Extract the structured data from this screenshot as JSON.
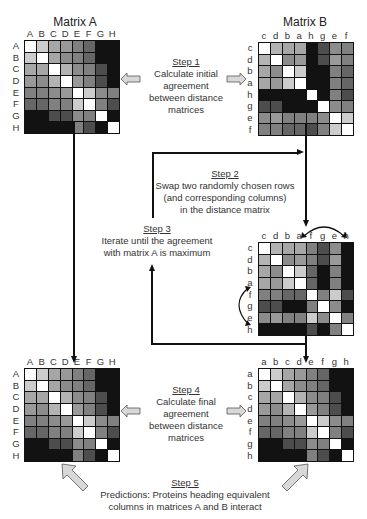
{
  "titles": {
    "matrix_a": "Matrix A",
    "matrix_b": "Matrix B"
  },
  "matrices": {
    "top_left": {
      "cols": [
        "A",
        "B",
        "C",
        "D",
        "E",
        "F",
        "G",
        "H"
      ],
      "rows": [
        "A",
        "B",
        "C",
        "D",
        "E",
        "F",
        "G",
        "H"
      ],
      "values": [
        [
          0,
          0.2,
          0.35,
          0.4,
          0.5,
          0.6,
          0.93,
          0.93
        ],
        [
          0.2,
          0,
          0.35,
          0.45,
          0.5,
          0.6,
          0.93,
          0.93
        ],
        [
          0.35,
          0.35,
          0,
          0.3,
          0.45,
          0.5,
          0.7,
          0.93
        ],
        [
          0.4,
          0.45,
          0.3,
          0,
          0.4,
          0.5,
          0.7,
          0.93
        ],
        [
          0.5,
          0.5,
          0.45,
          0.4,
          0,
          0.2,
          0.45,
          0.5
        ],
        [
          0.6,
          0.6,
          0.5,
          0.5,
          0.2,
          0,
          0.5,
          0.7
        ],
        [
          0.93,
          0.93,
          0.7,
          0.7,
          0.45,
          0.5,
          0,
          0.93
        ],
        [
          0.93,
          0.93,
          0.93,
          0.93,
          0.5,
          0.7,
          0.93,
          0
        ]
      ]
    },
    "top_right": {
      "cols": [
        "c",
        "d",
        "b",
        "a",
        "h",
        "g",
        "e",
        "f"
      ],
      "rows": [
        "c",
        "d",
        "b",
        "a",
        "h",
        "g",
        "e",
        "f"
      ],
      "values": [
        [
          0,
          0.3,
          0.35,
          0.35,
          0.93,
          0.7,
          0.45,
          0.5
        ],
        [
          0.3,
          0,
          0.45,
          0.4,
          0.93,
          0.7,
          0.4,
          0.5
        ],
        [
          0.35,
          0.45,
          0,
          0.2,
          0.93,
          0.93,
          0.5,
          0.6
        ],
        [
          0.35,
          0.4,
          0.2,
          0,
          0.93,
          0.93,
          0.5,
          0.6
        ],
        [
          0.93,
          0.93,
          0.93,
          0.93,
          0,
          0.93,
          0.5,
          0.7
        ],
        [
          0.7,
          0.7,
          0.93,
          0.93,
          0.93,
          0,
          0.45,
          0.5
        ],
        [
          0.45,
          0.4,
          0.5,
          0.5,
          0.5,
          0.45,
          0,
          0.2
        ],
        [
          0.5,
          0.5,
          0.6,
          0.6,
          0.7,
          0.5,
          0.2,
          0
        ]
      ]
    },
    "middle_right": {
      "cols": [
        "c",
        "d",
        "b",
        "a",
        "f",
        "g",
        "e",
        "h"
      ],
      "rows": [
        "c",
        "d",
        "b",
        "a",
        "f",
        "g",
        "e",
        "h"
      ],
      "values": [
        [
          0,
          0.3,
          0.35,
          0.35,
          0.5,
          0.7,
          0.45,
          0.93
        ],
        [
          0.3,
          0,
          0.45,
          0.4,
          0.5,
          0.7,
          0.4,
          0.93
        ],
        [
          0.35,
          0.45,
          0,
          0.2,
          0.6,
          0.93,
          0.5,
          0.93
        ],
        [
          0.35,
          0.4,
          0.2,
          0,
          0.6,
          0.93,
          0.5,
          0.93
        ],
        [
          0.5,
          0.5,
          0.6,
          0.6,
          0,
          0.5,
          0.2,
          0.7
        ],
        [
          0.7,
          0.7,
          0.93,
          0.93,
          0.5,
          0,
          0.45,
          0.93
        ],
        [
          0.45,
          0.4,
          0.5,
          0.5,
          0.2,
          0.45,
          0,
          0.5
        ],
        [
          0.93,
          0.93,
          0.93,
          0.93,
          0.7,
          0.93,
          0.5,
          0
        ]
      ]
    },
    "bottom_left": {
      "cols": [
        "A",
        "B",
        "C",
        "D",
        "E",
        "F",
        "G",
        "H"
      ],
      "rows": [
        "A",
        "B",
        "C",
        "D",
        "E",
        "F",
        "G",
        "H"
      ],
      "values": [
        [
          0,
          0.2,
          0.35,
          0.4,
          0.5,
          0.6,
          0.93,
          0.93
        ],
        [
          0.2,
          0,
          0.35,
          0.45,
          0.5,
          0.6,
          0.93,
          0.93
        ],
        [
          0.35,
          0.35,
          0,
          0.3,
          0.45,
          0.5,
          0.7,
          0.93
        ],
        [
          0.4,
          0.45,
          0.3,
          0,
          0.4,
          0.5,
          0.7,
          0.93
        ],
        [
          0.5,
          0.5,
          0.45,
          0.4,
          0,
          0.2,
          0.45,
          0.5
        ],
        [
          0.6,
          0.6,
          0.5,
          0.5,
          0.2,
          0,
          0.5,
          0.7
        ],
        [
          0.93,
          0.93,
          0.7,
          0.7,
          0.45,
          0.5,
          0,
          0.93
        ],
        [
          0.93,
          0.93,
          0.93,
          0.93,
          0.5,
          0.7,
          0.93,
          0
        ]
      ]
    },
    "bottom_right": {
      "cols": [
        "a",
        "b",
        "c",
        "d",
        "e",
        "f",
        "g",
        "h"
      ],
      "rows": [
        "a",
        "b",
        "c",
        "d",
        "e",
        "f",
        "g",
        "h"
      ],
      "values": [
        [
          0,
          0.2,
          0.35,
          0.4,
          0.5,
          0.6,
          0.93,
          0.93
        ],
        [
          0.2,
          0,
          0.35,
          0.45,
          0.5,
          0.6,
          0.93,
          0.93
        ],
        [
          0.35,
          0.35,
          0,
          0.3,
          0.45,
          0.5,
          0.7,
          0.93
        ],
        [
          0.4,
          0.45,
          0.3,
          0,
          0.4,
          0.5,
          0.7,
          0.93
        ],
        [
          0.5,
          0.5,
          0.45,
          0.4,
          0,
          0.2,
          0.45,
          0.5
        ],
        [
          0.6,
          0.6,
          0.5,
          0.5,
          0.2,
          0,
          0.5,
          0.7
        ],
        [
          0.93,
          0.93,
          0.7,
          0.7,
          0.45,
          0.5,
          0,
          0.93
        ],
        [
          0.93,
          0.93,
          0.93,
          0.93,
          0.5,
          0.7,
          0.93,
          0
        ]
      ]
    }
  },
  "steps": [
    {
      "label": "Step 1",
      "lines": [
        "Calculate initial",
        "agreement",
        "between distance",
        "matrices"
      ]
    },
    {
      "label": "Step 2",
      "lines": [
        "Swap two randomly chosen rows",
        "(and corresponding columns)",
        "in the distance matrix"
      ]
    },
    {
      "label": "Step 3",
      "lines": [
        "Iterate until the agreement",
        "with matrix A is maximum"
      ]
    },
    {
      "label": "Step 4",
      "lines": [
        "Calculate final",
        "agreement",
        "between distance",
        "matrices"
      ]
    },
    {
      "label": "Step 5",
      "lines": [
        "Predictions: Proteins heading equivalent",
        "columns in matrices A and B interact"
      ]
    }
  ],
  "colors": {
    "grid_line": "#111111",
    "arrow_fill": "#d8d8d8",
    "arrow_stroke": "#555555",
    "text": "#333333"
  }
}
